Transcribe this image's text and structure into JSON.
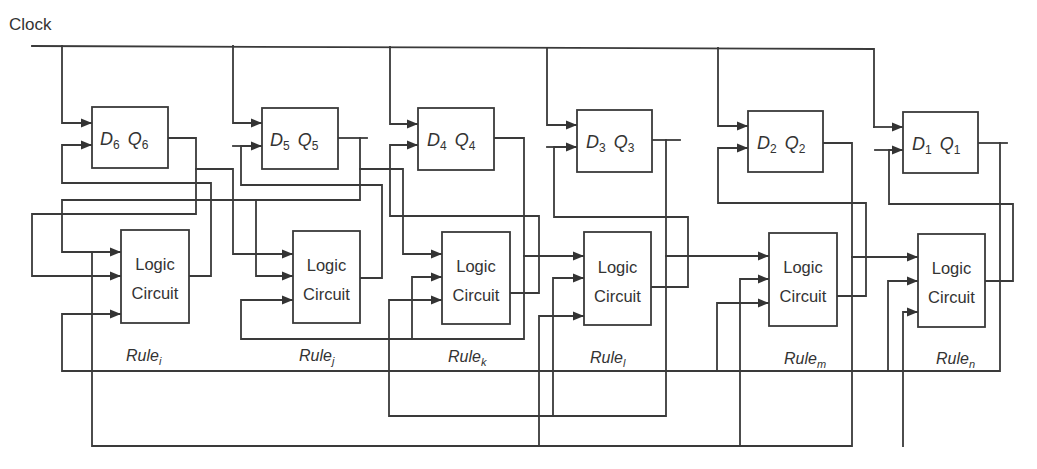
{
  "diagram": {
    "clock_label": "Clock",
    "stroke_color": "#3a3a3a",
    "background": "#ffffff",
    "flip_flops": [
      {
        "d": "D",
        "d_sub": "6",
        "q": "Q",
        "q_sub": "6"
      },
      {
        "d": "D",
        "d_sub": "5",
        "q": "Q",
        "q_sub": "5"
      },
      {
        "d": "D",
        "d_sub": "4",
        "q": "Q",
        "q_sub": "4"
      },
      {
        "d": "D",
        "d_sub": "3",
        "q": "Q",
        "q_sub": "3"
      },
      {
        "d": "D",
        "d_sub": "2",
        "q": "Q",
        "q_sub": "2"
      },
      {
        "d": "D",
        "d_sub": "1",
        "q": "Q",
        "q_sub": "1"
      }
    ],
    "logic_circuits": [
      {
        "line1": "Logic",
        "line2": "Circuit",
        "rule": "Rule",
        "rule_sub": "i"
      },
      {
        "line1": "Logic",
        "line2": "Circuit",
        "rule": "Rule",
        "rule_sub": "j"
      },
      {
        "line1": "Logic",
        "line2": "Circuit",
        "rule": "Rule",
        "rule_sub": "k"
      },
      {
        "line1": "Logic",
        "line2": "Circuit",
        "rule": "Rule",
        "rule_sub": "l"
      },
      {
        "line1": "Logic",
        "line2": "Circuit",
        "rule": "Rule",
        "rule_sub": "m"
      },
      {
        "line1": "Logic",
        "line2": "Circuit",
        "rule": "Rule",
        "rule_sub": "n"
      }
    ]
  }
}
